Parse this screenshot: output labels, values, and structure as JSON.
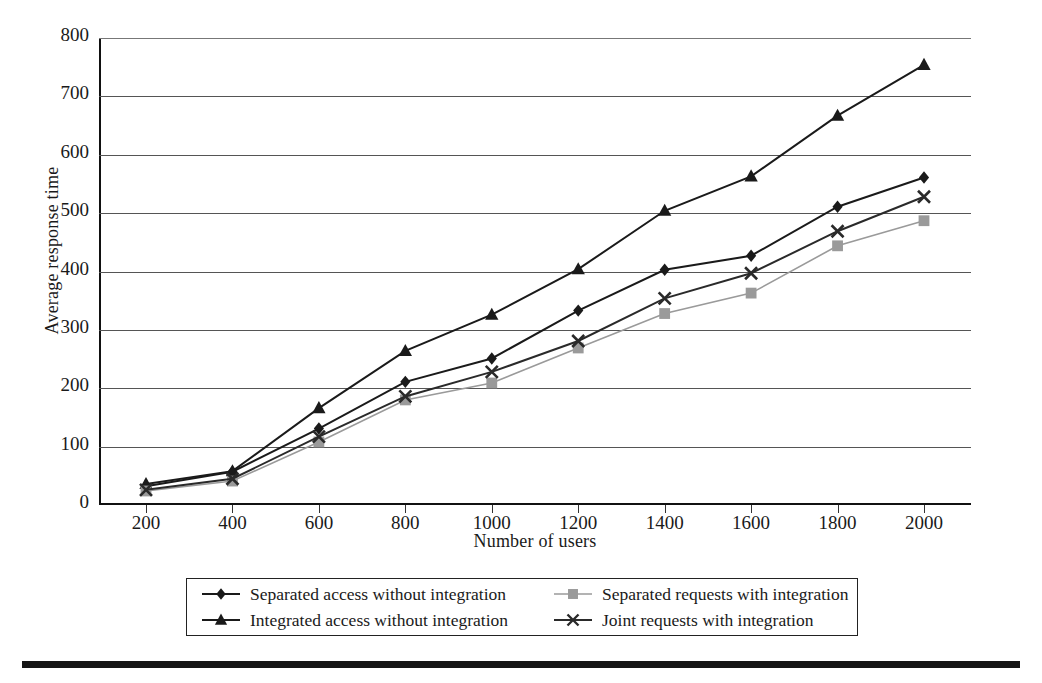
{
  "chart_data": {
    "type": "line",
    "title": "",
    "xlabel": "Number of users",
    "ylabel": "Average response time",
    "x": [
      200,
      400,
      600,
      800,
      1000,
      1200,
      1400,
      1600,
      1800,
      2000
    ],
    "xtick_labels": [
      "200",
      "400",
      "600",
      "800",
      "1000",
      "1200",
      "1400",
      "1600",
      "1800",
      "2000"
    ],
    "ytick_labels": [
      "0",
      "100",
      "200",
      "300",
      "400",
      "500",
      "600",
      "700",
      "800"
    ],
    "yticks": [
      0,
      100,
      200,
      300,
      400,
      500,
      600,
      700,
      800
    ],
    "ylim": [
      0,
      800
    ],
    "xlim": [
      200,
      2000
    ],
    "grid": "horizontal",
    "legend_position": "below-plot",
    "series": [
      {
        "name": "Separated access without integration",
        "marker": "diamond",
        "color": "#1a1a1a",
        "values": [
          32,
          57,
          131,
          211,
          251,
          333,
          403,
          427,
          511,
          561
        ]
      },
      {
        "name": "Integrated access without integration",
        "marker": "triangle",
        "color": "#1a1a1a",
        "values": [
          36,
          58,
          166,
          264,
          326,
          404,
          504,
          563,
          667,
          754
        ]
      },
      {
        "name": "Separated requests with integration",
        "marker": "square",
        "color": "#9a9a9a",
        "values": [
          24,
          41,
          108,
          180,
          209,
          269,
          328,
          363,
          444,
          487
        ]
      },
      {
        "name": "Joint requests with integration",
        "marker": "cross",
        "color": "#2a2a2a",
        "values": [
          26,
          45,
          117,
          186,
          228,
          281,
          354,
          397,
          469,
          528
        ]
      }
    ]
  },
  "legend": {
    "entries": [
      {
        "label": "Separated access without integration",
        "marker": "diamond",
        "color": "#1a1a1a"
      },
      {
        "label": "Separated requests with integration",
        "marker": "square",
        "color": "#9a9a9a"
      },
      {
        "label": "Integrated access without integration",
        "marker": "triangle",
        "color": "#1a1a1a"
      },
      {
        "label": "Joint requests with integration",
        "marker": "cross",
        "color": "#2a2a2a"
      }
    ]
  }
}
